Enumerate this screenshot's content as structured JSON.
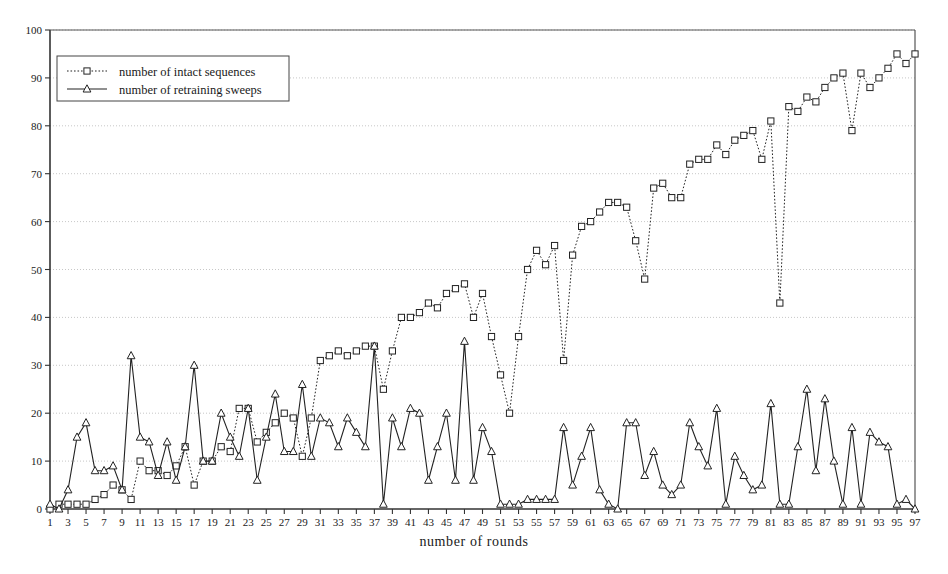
{
  "chart_data": {
    "type": "line",
    "title": "",
    "xlabel": "number of rounds",
    "ylabel": "",
    "xlim": [
      1,
      97
    ],
    "ylim": [
      0,
      100
    ],
    "ytick_step": 10,
    "xtick_step": 2,
    "xtick_start": 1,
    "grid": true,
    "grid_axis": "y",
    "legend_position": "top-left",
    "x": [
      1,
      2,
      3,
      4,
      5,
      6,
      7,
      8,
      9,
      10,
      11,
      12,
      13,
      14,
      15,
      16,
      17,
      18,
      19,
      20,
      21,
      22,
      23,
      24,
      25,
      26,
      27,
      28,
      29,
      30,
      31,
      32,
      33,
      34,
      35,
      36,
      37,
      38,
      39,
      40,
      41,
      42,
      43,
      44,
      45,
      46,
      47,
      48,
      49,
      50,
      51,
      52,
      53,
      54,
      55,
      56,
      57,
      58,
      59,
      60,
      61,
      62,
      63,
      64,
      65,
      66,
      67,
      68,
      69,
      70,
      71,
      72,
      73,
      74,
      75,
      76,
      77,
      78,
      79,
      80,
      81,
      82,
      83,
      84,
      85,
      86,
      87,
      88,
      89,
      90,
      91,
      92,
      93,
      94,
      95,
      96,
      97
    ],
    "xticklabels": [
      "1",
      "3",
      "5",
      "7",
      "9",
      "11",
      "13",
      "15",
      "17",
      "19",
      "21",
      "23",
      "25",
      "27",
      "29",
      "31",
      "33",
      "35",
      "37",
      "39",
      "41",
      "43",
      "45",
      "47",
      "49",
      "51",
      "53",
      "55",
      "57",
      "59",
      "61",
      "63",
      "65",
      "67",
      "69",
      "71",
      "73",
      "75",
      "77",
      "79",
      "81",
      "83",
      "85",
      "87",
      "89",
      "91",
      "93",
      "95",
      "97"
    ],
    "yticklabels": [
      "0",
      "10",
      "20",
      "30",
      "40",
      "50",
      "60",
      "70",
      "80",
      "90",
      "100"
    ],
    "series": [
      {
        "name": "number of intact sequences",
        "marker": "square",
        "linestyle": "dotted",
        "color": "#222222",
        "values": [
          0,
          1,
          1,
          1,
          1,
          2,
          3,
          5,
          4,
          2,
          10,
          8,
          8,
          7,
          9,
          13,
          5,
          10,
          10,
          13,
          12,
          21,
          21,
          14,
          16,
          18,
          20,
          19,
          11,
          19,
          31,
          32,
          33,
          32,
          33,
          34,
          34,
          25,
          33,
          40,
          40,
          41,
          43,
          42,
          45,
          46,
          47,
          40,
          45,
          36,
          28,
          20,
          36,
          50,
          54,
          51,
          55,
          31,
          53,
          59,
          60,
          62,
          64,
          64,
          63,
          56,
          48,
          67,
          68,
          65,
          65,
          72,
          73,
          73,
          76,
          74,
          77,
          78,
          79,
          73,
          81,
          43,
          84,
          83,
          86,
          85,
          88,
          90,
          91,
          79,
          91,
          88,
          90,
          92,
          95,
          93,
          95
        ]
      },
      {
        "name": "number of retraining sweeps",
        "marker": "triangle",
        "linestyle": "solid",
        "color": "#222222",
        "values": [
          1,
          0,
          4,
          15,
          18,
          8,
          8,
          9,
          4,
          32,
          15,
          14,
          7,
          14,
          6,
          13,
          30,
          10,
          10,
          20,
          15,
          11,
          21,
          6,
          15,
          24,
          12,
          12,
          26,
          11,
          19,
          18,
          13,
          19,
          16,
          13,
          34,
          1,
          19,
          13,
          21,
          20,
          6,
          13,
          20,
          6,
          35,
          6,
          17,
          12,
          1,
          1,
          1,
          2,
          2,
          2,
          2,
          17,
          5,
          11,
          17,
          4,
          1,
          0,
          18,
          18,
          7,
          12,
          5,
          3,
          5,
          18,
          13,
          9,
          21,
          1,
          11,
          7,
          4,
          5,
          22,
          1,
          1,
          13,
          25,
          8,
          23,
          10,
          1,
          17,
          1,
          16,
          14,
          13,
          1,
          2,
          0
        ]
      }
    ]
  },
  "legend": {
    "entries": [
      {
        "label": "number of intact sequences"
      },
      {
        "label": "number of retraining sweeps"
      }
    ]
  },
  "axis": {
    "x_label": "number of rounds"
  }
}
